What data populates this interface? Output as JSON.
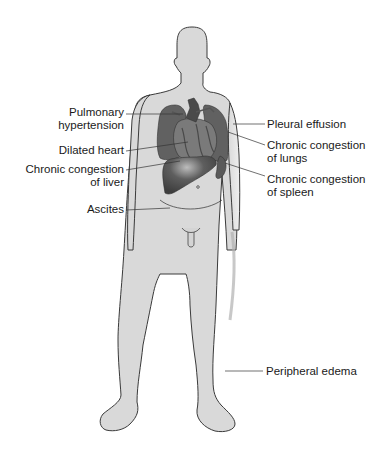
{
  "diagram": {
    "type": "anatomical-illustration",
    "colors": {
      "body_fill": "#d9d9d9",
      "body_outline": "#3a3a3a",
      "organ_dark": "#555555",
      "organ_mid": "#707070",
      "leader_line": "#333333",
      "text": "#1a1a1a"
    },
    "labels_left": [
      {
        "id": "pulmonary-hypertension",
        "line1": "Pulmonary",
        "line2": "hypertension"
      },
      {
        "id": "dilated-heart",
        "line1": "Dilated heart",
        "line2": ""
      },
      {
        "id": "chronic-congestion-liver",
        "line1": "Chronic congestion",
        "line2": "of liver"
      },
      {
        "id": "ascites",
        "line1": "Ascites",
        "line2": ""
      }
    ],
    "labels_right": [
      {
        "id": "pleural-effusion",
        "line1": "Pleural effusion",
        "line2": ""
      },
      {
        "id": "chronic-congestion-lungs",
        "line1": "Chronic congestion",
        "line2": "of lungs"
      },
      {
        "id": "chronic-congestion-spleen",
        "line1": "Chronic congestion",
        "line2": "of spleen"
      },
      {
        "id": "peripheral-edema",
        "line1": "Peripheral edema",
        "line2": ""
      }
    ]
  }
}
